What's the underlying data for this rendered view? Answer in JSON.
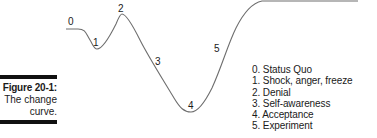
{
  "figure": {
    "number_label": "Figure 20-1:",
    "caption_line1": "The change",
    "caption_line2": "curve."
  },
  "curve_points": [
    {
      "id": "0",
      "label": "0"
    },
    {
      "id": "1",
      "label": "1"
    },
    {
      "id": "2",
      "label": "2"
    },
    {
      "id": "3",
      "label": "3"
    },
    {
      "id": "4",
      "label": "4"
    },
    {
      "id": "5",
      "label": "5"
    }
  ],
  "legend": {
    "items": [
      "0. Status Quo",
      "1. Shock, anger, freeze",
      "2. Denial",
      "3. Self-awareness",
      "4. Acceptance",
      "5. Experiment"
    ]
  },
  "colors": {
    "curve": "#6e6e6e",
    "bar": "#111111",
    "text": "#1a1a1a"
  }
}
